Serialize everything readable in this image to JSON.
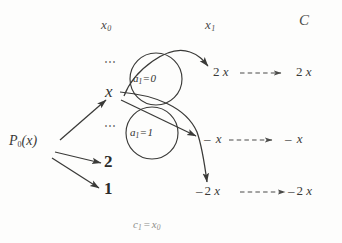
{
  "figure": {
    "type": "tree-diagram",
    "background_color": "#fdfdfc",
    "ink_color": "#3a3a38",
    "caption": {
      "symbol": "c",
      "sub": "1",
      "eq": "=",
      "value": "x",
      "value_sub": "0",
      "full": "c1 = x0"
    }
  },
  "columns": [
    {
      "id": "x0",
      "label": "x",
      "sub": "0"
    },
    {
      "id": "x1",
      "label": "x",
      "sub": "1"
    },
    {
      "id": "C",
      "label": "C",
      "sub": ""
    }
  ],
  "root": {
    "label": "P",
    "sub": "0",
    "arg": "(x)",
    "full": "P0(x)"
  },
  "nodes": {
    "x_node": "x",
    "ellipsis_above": "⋯",
    "ellipsis_below": "⋯",
    "branch_two": "2",
    "branch_one": "1"
  },
  "conditions": [
    {
      "id": "a1-eq-0",
      "symbol": "a",
      "sub": "1",
      "eq": "=",
      "value": "0",
      "full": "a1 = 0"
    },
    {
      "id": "a1-eq-1",
      "symbol": "a",
      "sub": "1",
      "eq": "=",
      "value": "1",
      "full": "a1 = 1"
    }
  ],
  "outputs": [
    {
      "id": "two-x",
      "x1": {
        "minus": "",
        "coef": "2",
        "var": "x"
      },
      "c": {
        "minus": "",
        "coef": "2",
        "var": "x"
      }
    },
    {
      "id": "minus-x",
      "x1": {
        "minus": "–",
        "coef": "",
        "var": "x"
      },
      "c": {
        "minus": "–",
        "coef": "",
        "var": "x"
      }
    },
    {
      "id": "minus-two-x",
      "x1": {
        "minus": "–",
        "coef": "2",
        "var": "x"
      },
      "c": {
        "minus": "–",
        "coef": "2",
        "var": "x"
      }
    }
  ]
}
